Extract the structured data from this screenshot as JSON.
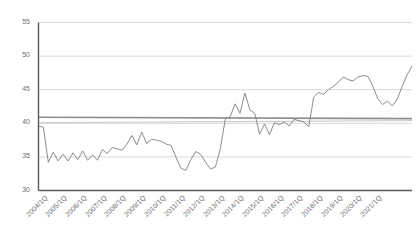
{
  "chart_data": {
    "type": "line",
    "title": "",
    "subtitle": "",
    "xlabel": "",
    "ylabel": "",
    "ylim": [
      30,
      55
    ],
    "ytick_values": [
      30,
      35,
      40,
      45,
      50,
      55
    ],
    "ytick_labels": [
      "30",
      "35",
      "40",
      "45",
      "50",
      "55"
    ],
    "grid": "horizontal",
    "legend": "none",
    "xtick_labels": [
      "2004/1Q",
      "2005/1Q",
      "2006/1Q",
      "2007/1Q",
      "2008/1Q",
      "2009/1Q",
      "2010/1Q",
      "2011/1Q",
      "2012/1Q",
      "2013/1Q",
      "2014/1Q",
      "2015/1Q",
      "2016/1Q",
      "2017/1Q",
      "2018/1Q",
      "2019/1Q",
      "2020/1Q",
      "2021/1Q"
    ],
    "x_start_label": "2004/1Q",
    "x_end_label": "2021/4Q",
    "series": [
      {
        "name": "quarterly-series",
        "color": "#808080",
        "values": [
          39.6,
          39.4,
          34.2,
          35.7,
          34.4,
          35.4,
          34.4,
          35.6,
          34.6,
          35.9,
          34.5,
          35.3,
          34.5,
          36.1,
          35.5,
          36.4,
          36.2,
          36.0,
          36.9,
          38.2,
          36.8,
          38.7,
          37.0,
          37.6,
          37.5,
          37.3,
          36.9,
          36.7,
          34.9,
          33.3,
          33.0,
          34.6,
          35.8,
          35.4,
          34.2,
          33.2,
          33.5,
          36.2,
          40.6,
          41.0,
          42.9,
          41.5,
          44.5,
          42.0,
          41.5,
          38.4,
          39.9,
          38.3,
          40.1,
          39.8,
          40.2,
          39.6,
          40.6,
          40.4,
          40.2,
          39.5,
          43.9,
          44.6,
          44.3,
          45.0,
          45.5,
          46.1,
          46.9,
          46.5,
          46.3,
          46.9,
          47.1,
          47.0,
          45.6,
          43.7,
          42.8,
          43.3,
          42.6,
          43.6,
          45.5,
          47.2,
          48.5
        ]
      }
    ],
    "reference_lines": [
      {
        "name": "upper-reference-line",
        "color": "#8c8c8c",
        "y_start": 40.9,
        "y_end": 40.7,
        "width": 1.6
      },
      {
        "name": "lower-reference-line",
        "color": "#c9c9c9",
        "y_start": 40.1,
        "y_end": 40.4,
        "width": 1.0
      }
    ],
    "axis_color": "#595959",
    "gridline_color": "#d9d9d9",
    "background_color": "#ffffff"
  }
}
